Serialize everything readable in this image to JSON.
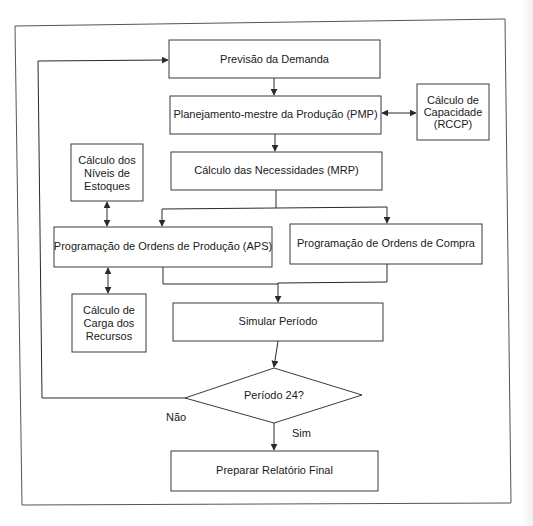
{
  "diagram": {
    "type": "flowchart",
    "language": "pt-BR",
    "nodes": {
      "previsao": {
        "label": "Previsão da Demanda"
      },
      "pmp": {
        "label": "Planejamento-mestre da Produção (PMP)"
      },
      "rccp": {
        "line1": "Cálculo de",
        "line2": "Capacidade",
        "line3": "(RCCP)"
      },
      "mrp": {
        "label": "Cálculo das Necessidades (MRP)"
      },
      "estoques": {
        "line1": "Cálculo dos",
        "line2": "Níveis de",
        "line3": "Estoques"
      },
      "aps": {
        "label": "Programação de Ordens de Produção (APS)"
      },
      "compra": {
        "label": "Programação de Ordens de Compra"
      },
      "recursos": {
        "line1": "Cálculo de",
        "line2": "Carga dos",
        "line3": "Recursos"
      },
      "simular": {
        "label": "Simular Período"
      },
      "decisao": {
        "label": "Período 24?"
      },
      "relatorio": {
        "label": "Preparar Relatório Final"
      }
    },
    "edge_labels": {
      "no": "Não",
      "yes": "Sim"
    },
    "edges": [
      {
        "from": "previsao",
        "to": "pmp"
      },
      {
        "from": "pmp",
        "to": "rccp",
        "bidirectional": true
      },
      {
        "from": "pmp",
        "to": "mrp"
      },
      {
        "from": "mrp",
        "to": "aps"
      },
      {
        "from": "mrp",
        "to": "compra"
      },
      {
        "from": "estoques",
        "to": "aps",
        "bidirectional": true
      },
      {
        "from": "aps",
        "to": "recursos",
        "bidirectional": true
      },
      {
        "from": "aps",
        "to": "simular"
      },
      {
        "from": "compra",
        "to": "simular"
      },
      {
        "from": "simular",
        "to": "decisao"
      },
      {
        "from": "decisao",
        "to": "previsao",
        "label": "Não"
      },
      {
        "from": "decisao",
        "to": "relatorio",
        "label": "Sim"
      }
    ],
    "colors": {
      "stroke": "#3a3a3a",
      "text": "#1a1a1a",
      "background": "#ffffff",
      "frame": "#555555"
    }
  }
}
